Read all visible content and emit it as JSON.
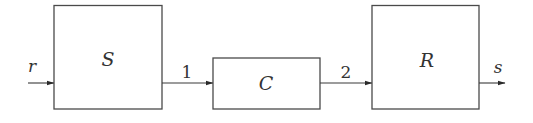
{
  "diagram": {
    "type": "block-diagram",
    "colors": {
      "stroke": "#4a4a4a",
      "text": "#333333",
      "background": "#ffffff"
    },
    "input": {
      "label": "r"
    },
    "output": {
      "label": "s"
    },
    "blocks": [
      {
        "id": "S",
        "label": "S"
      },
      {
        "id": "C",
        "label": "C"
      },
      {
        "id": "R",
        "label": "R"
      }
    ],
    "edges": [
      {
        "from": "input",
        "to": "S",
        "label": "r"
      },
      {
        "from": "S",
        "to": "C",
        "label": "1"
      },
      {
        "from": "C",
        "to": "R",
        "label": "2"
      },
      {
        "from": "R",
        "to": "output",
        "label": "s"
      }
    ]
  }
}
